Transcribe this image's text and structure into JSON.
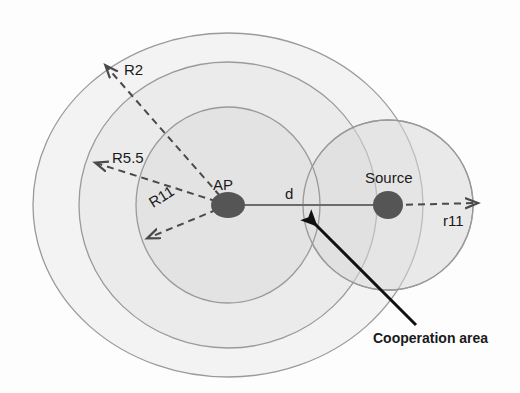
{
  "diagram": {
    "nodes": [
      {
        "id": "ap",
        "label": "AP",
        "cx": 228,
        "cy": 205,
        "rx": 17,
        "ry": 13,
        "color": "#555555"
      },
      {
        "id": "source",
        "label": "Source",
        "cx": 388,
        "cy": 205,
        "rx": 15,
        "ry": 14,
        "color": "#555555"
      }
    ],
    "coverage_rings": [
      {
        "id": "ring-outer",
        "label": "R2",
        "cx": 228,
        "cy": 205,
        "rx": 195,
        "ry": 172,
        "fill": "#f3f3f3",
        "stroke": "#9a9a9a"
      },
      {
        "id": "ring-middle",
        "label": "R5.5",
        "cx": 228,
        "cy": 205,
        "rx": 149,
        "ry": 143,
        "fill": "#ebebeb",
        "stroke": "#9a9a9a"
      },
      {
        "id": "ring-inner",
        "label": "R11",
        "cx": 228,
        "cy": 205,
        "rx": 92,
        "ry": 98,
        "fill": "#e1e1e1",
        "stroke": "#9a9a9a"
      }
    ],
    "source_ring": {
      "id": "source-coverage",
      "label": "r11",
      "cx": 388,
      "cy": 205,
      "r": 85,
      "fill": "#ebebeb",
      "stroke": "#9a9a9a"
    },
    "radius_labels": {
      "r2": "R2",
      "r55": "R5.5",
      "r11": "R11",
      "r11_small": "r11"
    },
    "distance_label": "d",
    "annotation": {
      "label": "Cooperation area",
      "arrow_from": {
        "x": 416,
        "y": 325
      },
      "arrow_to": {
        "x": 313,
        "y": 222
      }
    },
    "colors": {
      "background": "#fdfdfd",
      "ring_outer_fill": "#f3f3f3",
      "ring_middle_fill": "#ebebeb",
      "ring_inner_fill": "#e1e1e1",
      "ring_stroke": "#9a9a9a",
      "node_fill": "#555555",
      "dashed_line": "#4a4a4a",
      "solid_line": "#6b6b6b",
      "annotation_arrow": "#111111",
      "text": "#1a1a1a"
    }
  }
}
